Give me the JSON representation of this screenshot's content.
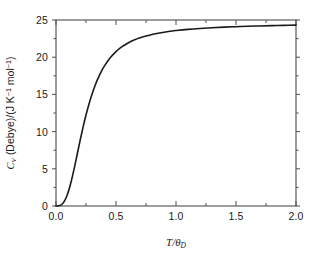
{
  "chart_data": {
    "type": "line",
    "title": "",
    "subtitle": "",
    "xlabel": "T/θ_D",
    "ylabel": "C_V (Debye)/(J K⁻¹ mol⁻¹)",
    "xlim": [
      0.0,
      2.0
    ],
    "ylim": [
      0,
      25
    ],
    "grid": false,
    "legend": null,
    "x_major_ticks": [
      0.0,
      0.5,
      1.0,
      1.5,
      2.0
    ],
    "x_tick_labels": [
      "0.0",
      "0.5",
      "1.0",
      "1.5",
      "2.0"
    ],
    "x_minor_ticks": [
      0.25,
      0.75,
      1.25,
      1.75
    ],
    "y_major_ticks": [
      0,
      5,
      10,
      15,
      20,
      25
    ],
    "y_tick_labels": [
      "0",
      "5",
      "10",
      "15",
      "20",
      "25"
    ],
    "y_minor_ticks": [
      2.5,
      7.5,
      12.5,
      17.5,
      22.5
    ],
    "x_tick_direction": "in",
    "y_tick_direction": "out",
    "line_color": "#1a1a1a",
    "line_width": 1.6,
    "background_color": "#ffffff",
    "frame_color": "#4d4d4d",
    "series": [
      {
        "name": "Debye heat capacity",
        "x": [
          0.0,
          0.025,
          0.05,
          0.075,
          0.1,
          0.125,
          0.15,
          0.175,
          0.2,
          0.225,
          0.25,
          0.275,
          0.3,
          0.325,
          0.35,
          0.375,
          0.4,
          0.45,
          0.5,
          0.55,
          0.6,
          0.65,
          0.7,
          0.75,
          0.8,
          0.85,
          0.9,
          0.95,
          1.0,
          1.1,
          1.2,
          1.3,
          1.4,
          1.5,
          1.6,
          1.7,
          1.8,
          1.9,
          2.0
        ],
        "y": [
          0.0,
          0.03,
          0.24,
          0.79,
          1.78,
          3.19,
          4.92,
          6.82,
          8.74,
          10.56,
          12.23,
          13.72,
          15.03,
          16.17,
          17.15,
          18.0,
          18.73,
          19.89,
          20.75,
          21.41,
          21.91,
          22.3,
          22.61,
          22.85,
          23.06,
          23.22,
          23.36,
          23.48,
          23.58,
          23.74,
          23.86,
          23.96,
          24.04,
          24.1,
          24.16,
          24.2,
          24.24,
          24.28,
          24.31
        ]
      }
    ]
  },
  "axes": {
    "x_title_parts": {
      "numerator": "T",
      "slash": "/",
      "denominator_symbol": "θ",
      "denominator_sub": "D"
    },
    "y_title_parts": {
      "symbol": "C",
      "symbol_sub": "V",
      "model": " (Debye)/(J K",
      "exp1": "−1",
      "unit_mid": " mol",
      "exp2": "−1",
      "close": ")"
    }
  }
}
